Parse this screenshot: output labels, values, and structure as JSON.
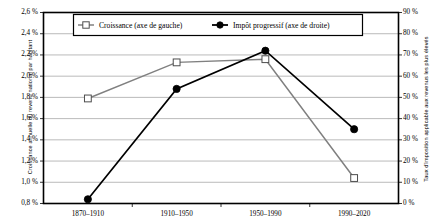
{
  "chart_data": {
    "type": "line",
    "title": "",
    "subtitle": "",
    "xlabel": "",
    "categories": [
      "1870–1910",
      "1910–1950",
      "1950–1990",
      "1990–2020"
    ],
    "grid": true,
    "legend_position": "top-center",
    "axes": {
      "left": {
        "label": "Croissance annuelle du revenu national par habitant",
        "ticks": [
          "0,8 %",
          "1,0 %",
          "1,2 %",
          "1,4 %",
          "1,6 %",
          "1,8 %",
          "2,0 %",
          "2,2 %",
          "2,4 %",
          "2,6 %"
        ],
        "tick_values": [
          0.8,
          1.0,
          1.2,
          1.4,
          1.6,
          1.8,
          2.0,
          2.2,
          2.4,
          2.6
        ],
        "ylim": [
          0.8,
          2.6
        ]
      },
      "right": {
        "label": "Taux d'imposition applicable aux revenus les plus élevés",
        "ticks": [
          "0 %",
          "10 %",
          "20 %",
          "30 %",
          "40 %",
          "50 %",
          "60 %",
          "70 %",
          "80 %",
          "90 %"
        ],
        "tick_values": [
          0,
          10,
          20,
          30,
          40,
          50,
          60,
          70,
          80,
          90
        ],
        "ylim": [
          0,
          90
        ]
      }
    },
    "series": [
      {
        "name": "Croissance (axe de gauche)",
        "axis": "left",
        "marker": "open-square",
        "color": "#808080",
        "values": [
          1.79,
          2.13,
          2.16,
          1.04
        ]
      },
      {
        "name": "Impôt progressif (axe de droite)",
        "axis": "right",
        "marker": "filled-circle",
        "color": "#000000",
        "values": [
          2,
          54,
          72,
          35
        ]
      }
    ],
    "legend": [
      {
        "label": "Croissance (axe de gauche)",
        "marker": "open-square",
        "color": "#808080"
      },
      {
        "label": "Impôt progressif (axe de droite)",
        "marker": "filled-circle",
        "color": "#000000"
      }
    ]
  }
}
